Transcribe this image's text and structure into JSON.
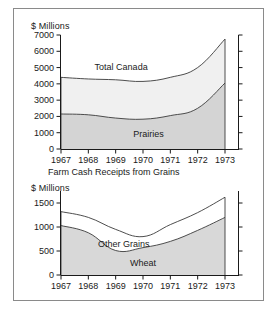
{
  "figure": {
    "caption_mid": "Farm Cash Receipts from Grains",
    "border_color": "#8a8a8a"
  },
  "chart_data": [
    {
      "id": "upper",
      "type": "area",
      "title": "",
      "ylabel": "$ Millions",
      "xlabel": "",
      "x": [
        "1967",
        "1968",
        "1969",
        "1970",
        "1971",
        "1972",
        "1973"
      ],
      "xticklabels": [
        "1967",
        "1968",
        "1969",
        "1970",
        "1971",
        "1972",
        "1973"
      ],
      "yticklabels": [
        "0",
        "1000",
        "2000",
        "3000",
        "4000",
        "5000",
        "6000",
        "7000"
      ],
      "yticks": [
        0,
        1000,
        2000,
        3000,
        4000,
        5000,
        6000,
        7000
      ],
      "ylim": [
        0,
        7000
      ],
      "grid": false,
      "legend": "inline-labels",
      "stacked": true,
      "series": [
        {
          "name": "Total Canada",
          "label_x": "1969.2",
          "label_y": 5050,
          "fill": "#f0f0f0",
          "values": [
            4400,
            4300,
            4250,
            4150,
            4400,
            5000,
            6750
          ]
        },
        {
          "name": "Prairies",
          "label_x": "1970.2",
          "label_y": 900,
          "fill": "#d4d4d4",
          "values": [
            2150,
            2100,
            1900,
            1830,
            2050,
            2500,
            4050
          ]
        }
      ]
    },
    {
      "id": "lower",
      "type": "area",
      "title": "",
      "ylabel": "$ Millions",
      "xlabel": "",
      "x": [
        "1967",
        "1968",
        "1969",
        "1970",
        "1971",
        "1972",
        "1973"
      ],
      "xticklabels": [
        "1967",
        "1968",
        "1969",
        "1970",
        "1971",
        "1972",
        "1973"
      ],
      "yticklabels": [
        "0",
        "500",
        "1000",
        "1500"
      ],
      "yticks": [
        0,
        500,
        1000,
        1500
      ],
      "ylim": [
        0,
        1750
      ],
      "grid": false,
      "legend": "inline-labels",
      "stacked": true,
      "series": [
        {
          "name": "Other Grains",
          "label_x": "1969.3",
          "label_y": 640,
          "fill": "#ffffff",
          "values": [
            1320,
            1200,
            950,
            800,
            1050,
            1300,
            1620
          ]
        },
        {
          "name": "Wheat",
          "label_x": "1970.0",
          "label_y": 255,
          "fill": "#d8d8d8",
          "values": [
            1030,
            880,
            510,
            570,
            700,
            930,
            1200
          ]
        }
      ]
    }
  ]
}
